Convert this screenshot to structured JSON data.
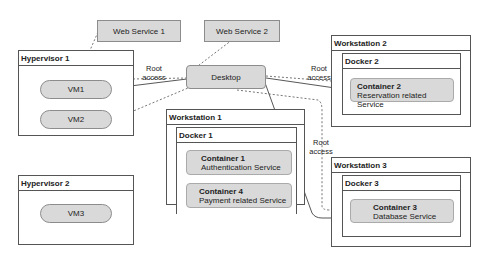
{
  "web_services": [
    {
      "label": "Web Service 1"
    },
    {
      "label": "Web Service 2"
    }
  ],
  "desktop": {
    "label": "Desktop"
  },
  "hypervisors": [
    {
      "title": "Hypervisor 1",
      "vms": [
        "VM1",
        "VM2"
      ]
    },
    {
      "title": "Hypervisor 2",
      "vms": [
        "VM3"
      ]
    }
  ],
  "workstations": [
    {
      "title": "Workstation 1",
      "docker": "Docker 1",
      "containers": [
        {
          "title": "Container 1",
          "desc": "Authentication Service"
        },
        {
          "title": "Container 4",
          "desc": "Payment related Service"
        }
      ]
    },
    {
      "title": "Workstation 2",
      "docker": "Docker 2",
      "containers": [
        {
          "title": "Container 2",
          "desc": "Reservation related Service"
        }
      ]
    },
    {
      "title": "Workstation 3",
      "docker": "Docker 3",
      "containers": [
        {
          "title": "Container 3",
          "desc": "Database Service"
        }
      ]
    }
  ],
  "edge_labels": {
    "root_access": "Root access"
  }
}
